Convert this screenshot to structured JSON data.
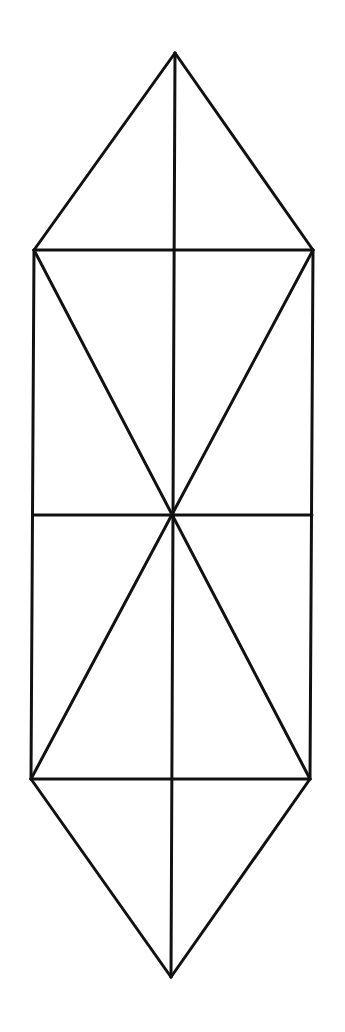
{
  "diagram": {
    "type": "geometric-figure",
    "stroke_color": "#111111",
    "background": "#ffffff",
    "stroke_width": 3,
    "vertices": {
      "top": [
        175,
        53
      ],
      "upper_left": [
        34,
        250
      ],
      "upper_right": [
        313,
        250
      ],
      "mid_left": [
        33,
        515
      ],
      "center": [
        172,
        515
      ],
      "mid_right": [
        312,
        515
      ],
      "lower_left": [
        31,
        779
      ],
      "lower_right": [
        310,
        779
      ],
      "bottom": [
        171,
        977
      ]
    },
    "segments": [
      [
        "top",
        "upper_left"
      ],
      [
        "top",
        "upper_right"
      ],
      [
        "upper_left",
        "upper_right"
      ],
      [
        "upper_left",
        "lower_left"
      ],
      [
        "upper_right",
        "lower_right"
      ],
      [
        "lower_left",
        "lower_right"
      ],
      [
        "lower_left",
        "bottom"
      ],
      [
        "lower_right",
        "bottom"
      ],
      [
        "top",
        "bottom"
      ],
      [
        "mid_left",
        "mid_right"
      ],
      [
        "upper_left",
        "lower_right"
      ],
      [
        "upper_right",
        "lower_left"
      ]
    ]
  }
}
